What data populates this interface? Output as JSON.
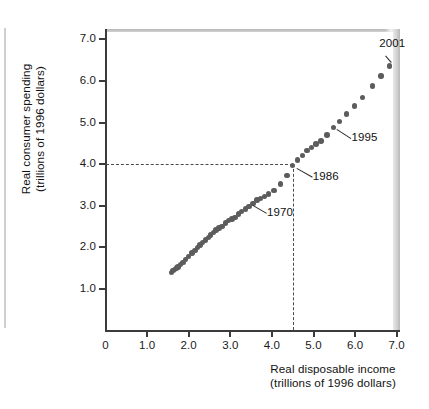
{
  "chart_data": {
    "type": "scatter",
    "title": "",
    "xlabel": "Real disposable income (trillions of 1996 dollars)",
    "ylabel": "Real consumer spending (trillions of 1996 dollars)",
    "xlabel_line1": "Real disposable income",
    "xlabel_line2": "(trillions of 1996 dollars)",
    "ylabel_line1": "Real consumer spending",
    "ylabel_line2": "(trillions of 1996 dollars)",
    "xlim": [
      0,
      7.4
    ],
    "ylim": [
      0,
      7.4
    ],
    "xticks": [
      0,
      1.0,
      2.0,
      3.0,
      4.0,
      5.0,
      6.0,
      7.0
    ],
    "xticklabels": [
      "0",
      "1.0",
      "2.0",
      "3.0",
      "4.0",
      "5.0",
      "6.0",
      "7.0"
    ],
    "yticks": [
      1.0,
      2.0,
      3.0,
      4.0,
      5.0,
      6.0,
      7.0
    ],
    "yticklabels": [
      "1.0",
      "2.0",
      "3.0",
      "4.0",
      "5.0",
      "6.0",
      "7.0"
    ],
    "grid": false,
    "legend": null,
    "marker_color": "#5c5c5c",
    "axis_color": "#3b3b3b",
    "x": [
      1.58,
      1.62,
      1.66,
      1.7,
      1.74,
      1.8,
      1.86,
      1.93,
      2.0,
      2.08,
      2.15,
      2.21,
      2.27,
      2.33,
      2.4,
      2.47,
      2.53,
      2.6,
      2.66,
      2.73,
      2.8,
      2.88,
      2.96,
      3.04,
      3.11,
      3.19,
      3.27,
      3.36,
      3.45,
      3.55,
      3.64,
      3.73,
      3.82,
      3.92,
      4.05,
      4.2,
      4.36,
      4.5,
      4.62,
      4.73,
      4.84,
      4.95,
      5.06,
      5.18,
      5.32,
      5.48,
      5.62,
      5.8,
      5.98,
      6.18,
      6.42,
      6.62,
      6.82
    ],
    "y": [
      1.4,
      1.44,
      1.47,
      1.5,
      1.53,
      1.58,
      1.64,
      1.71,
      1.78,
      1.86,
      1.93,
      2.0,
      2.06,
      2.12,
      2.18,
      2.24,
      2.3,
      2.36,
      2.42,
      2.46,
      2.5,
      2.58,
      2.64,
      2.68,
      2.72,
      2.8,
      2.86,
      2.92,
      2.98,
      3.06,
      3.14,
      3.18,
      3.22,
      3.28,
      3.36,
      3.52,
      3.72,
      3.96,
      4.1,
      4.2,
      4.32,
      4.4,
      4.48,
      4.56,
      4.7,
      4.88,
      5.02,
      5.2,
      5.4,
      5.6,
      5.88,
      6.12,
      6.36
    ],
    "annotations": [
      {
        "label": "1970",
        "point_x": 3.45,
        "point_y": 3.06
      },
      {
        "label": "1986",
        "point_x": 4.5,
        "point_y": 3.96
      },
      {
        "label": "1995",
        "point_x": 5.48,
        "point_y": 4.88
      },
      {
        "label": "2001",
        "point_x": 6.82,
        "point_y": 6.36
      }
    ],
    "reference_lines": [
      {
        "orientation": "horizontal",
        "value": 4.0,
        "style": "dashed",
        "from": 0,
        "to": 4.5
      },
      {
        "orientation": "vertical",
        "value": 4.5,
        "style": "dashed",
        "from": 0,
        "to": 4.0
      }
    ]
  },
  "axis": {
    "yticklabels": [
      "7.0",
      "6.0",
      "5.0",
      "4.0",
      "3.0",
      "2.0",
      "1.0"
    ],
    "xticklabels": [
      "0",
      "1.0",
      "2.0",
      "3.0",
      "4.0",
      "5.0",
      "6.0",
      "7.0"
    ]
  },
  "annotations": {
    "a1970": "1970",
    "a1986": "1986",
    "a1995": "1995",
    "a2001": "2001"
  },
  "labels": {
    "y_line1": "Real consumer spending",
    "y_line2": "(trillions of 1996 dollars)",
    "x_line1": "Real disposable income",
    "x_line2": "(trillions of 1996 dollars)"
  }
}
